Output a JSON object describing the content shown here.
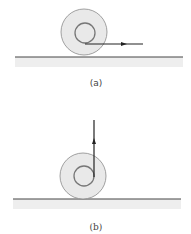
{
  "figure": {
    "panels": [
      {
        "id": "a",
        "caption": "(a)",
        "ground": {
          "x1": 15,
          "x2": 183,
          "y": 57
        },
        "wheel": {
          "cx": 84,
          "cy": 32,
          "outer_r": 23,
          "inner_r": 10
        },
        "arrow": {
          "direction": "horizontal-right",
          "x1": 85,
          "y1": 44,
          "x2": 143,
          "y2": 44
        }
      },
      {
        "id": "b",
        "caption": "(b)",
        "ground": {
          "x1": 13,
          "x2": 181,
          "y": 199
        },
        "wheel": {
          "cx": 83,
          "cy": 176,
          "outer_r": 23,
          "inner_r": 10
        },
        "arrow": {
          "direction": "vertical-up",
          "x1": 94,
          "y1": 177,
          "x2": 94,
          "y2": 120
        }
      }
    ],
    "colors": {
      "wheel_fill": "#e9e9e9",
      "wheel_stroke": "#8a8a8a",
      "line": "#222222",
      "ground_shadow": "#eeeeee"
    }
  }
}
